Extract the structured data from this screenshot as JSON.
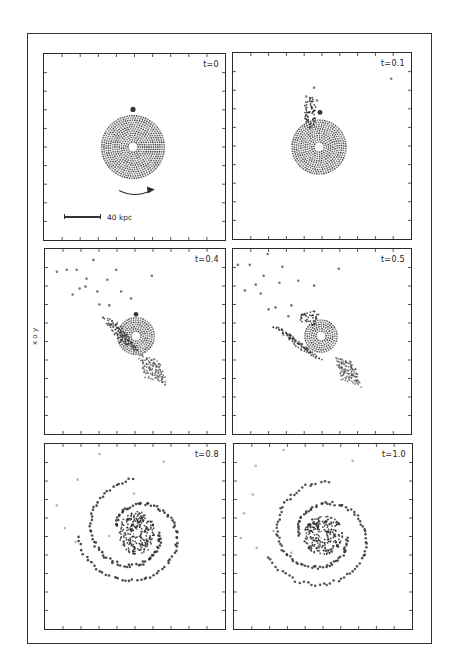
{
  "figure": {
    "y_axis_label": "x o y",
    "scale_bar_label": "40 kpc",
    "panels": [
      {
        "id": "p1",
        "time_label": "t=0"
      },
      {
        "id": "p2",
        "time_label": "t=0.1"
      },
      {
        "id": "p3",
        "time_label": "t=0.4"
      },
      {
        "id": "p4",
        "time_label": "t=0.5"
      },
      {
        "id": "p5",
        "time_label": "t=0.8"
      },
      {
        "id": "p6",
        "time_label": "t=1.0"
      }
    ]
  },
  "colors": {
    "ink": "#2a2a2a",
    "background": "#ffffff"
  }
}
